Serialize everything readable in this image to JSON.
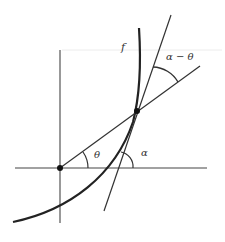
{
  "figure": {
    "type": "geometric-diagram",
    "colors": {
      "stroke": "#222222",
      "background": "#ffffff",
      "faint_line": "#e6e6e6"
    }
  },
  "labels": {
    "curve": "f",
    "theta": "θ",
    "alpha": "α",
    "alpha_minus_theta": "α − θ"
  },
  "points": {
    "origin": {
      "x": 60,
      "y": 168
    },
    "P": {
      "x": 137,
      "y": 111
    }
  },
  "lines": {
    "x_axis": {
      "x1": 15,
      "y1": 168,
      "x2": 207,
      "y2": 168
    },
    "y_axis": {
      "x1": 60,
      "y1": 50,
      "x2": 60,
      "y2": 223
    },
    "secant": {
      "x1": 60,
      "y1": 168,
      "x2": 200,
      "y2": 66
    },
    "tangent": {
      "x1": 104,
      "y1": 211,
      "x2": 171,
      "y2": 15
    }
  }
}
